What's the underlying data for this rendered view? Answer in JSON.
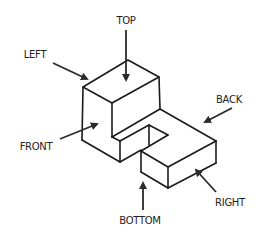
{
  "diagram": {
    "type": "isometric-view-orientation",
    "labels": {
      "top": "TOP",
      "left": "LEFT",
      "back": "BACK",
      "front": "FRONT",
      "bottom": "BOTTOM",
      "right": "RIGHT"
    },
    "colors": {
      "line": "#1a1a1a",
      "background": "#ffffff"
    }
  }
}
